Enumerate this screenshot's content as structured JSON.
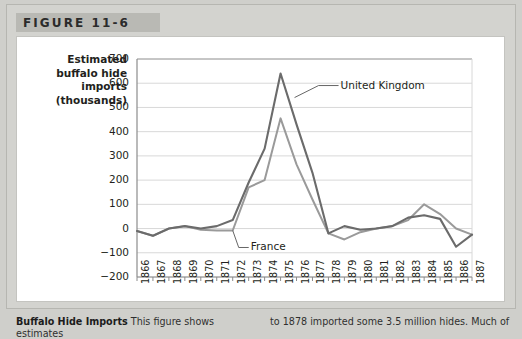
{
  "figure": {
    "header_label": "FIGURE 11-6"
  },
  "axis": {
    "y_title_lines": [
      "Estimated",
      "buffalo hide",
      "imports",
      "(thousands)"
    ],
    "y_ticks": [
      "700",
      "600",
      "500",
      "400",
      "300",
      "200",
      "100",
      "0",
      "-100",
      "-200"
    ],
    "x_ticks": [
      "1866",
      "1867",
      "1868",
      "1869",
      "1870",
      "1871",
      "1872",
      "1873",
      "1874",
      "1875",
      "1876",
      "1877",
      "1878",
      "1879",
      "1880",
      "1881",
      "1882",
      "1883",
      "1884",
      "1885",
      "1886",
      "1887"
    ]
  },
  "annotations": {
    "uk_label": "United Kingdom",
    "france_label": "France"
  },
  "caption": {
    "title": "Buffalo Hide Imports",
    "column_one": "This figure shows estimates",
    "column_two": "to 1878 imported some 3.5 million hides. Much of"
  },
  "colors": {
    "uk_line": "#6b6b6b",
    "france_line": "#9a9a9a",
    "gridline": "#d8d8d8",
    "axis": "#8c8c8c",
    "header_band": "#b9b9b4",
    "page_background": "#d3d3cf",
    "panel_background": "#ffffff"
  },
  "chart_data": {
    "type": "line",
    "title": "Buffalo Hide Imports",
    "xlabel": "",
    "ylabel": "Estimated buffalo hide imports (thousands)",
    "ylim": [
      -200,
      700
    ],
    "ytick_step": 100,
    "grid": true,
    "legend": "inline-annotations",
    "x": [
      1866,
      1867,
      1868,
      1869,
      1870,
      1871,
      1872,
      1873,
      1874,
      1875,
      1876,
      1877,
      1878,
      1879,
      1880,
      1881,
      1882,
      1883,
      1884,
      1885,
      1886,
      1887
    ],
    "series": [
      {
        "name": "United Kingdom",
        "color": "#6b6b6b",
        "values": [
          -10,
          -30,
          0,
          10,
          0,
          10,
          35,
          190,
          330,
          640,
          430,
          230,
          -20,
          10,
          -5,
          0,
          10,
          45,
          55,
          40,
          -75,
          -25
        ]
      },
      {
        "name": "France",
        "color": "#9a9a9a",
        "values": [
          -10,
          -30,
          0,
          10,
          -5,
          -8,
          -8,
          170,
          200,
          455,
          265,
          120,
          -20,
          -45,
          -15,
          0,
          10,
          35,
          100,
          60,
          0,
          -25
        ]
      }
    ]
  }
}
